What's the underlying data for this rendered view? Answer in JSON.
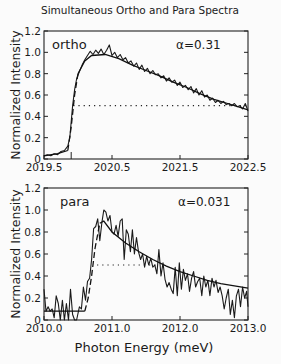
{
  "figure": {
    "title": "Simultaneous Ortho and Para Spectra",
    "xlabel": "Photon Energy (meV)"
  },
  "chart_data": [
    {
      "type": "line",
      "panel": "top",
      "label": "ortho",
      "annotation": "α=0.31",
      "ylabel": "Normalized Intensity",
      "xlabel": "Photon Energy (meV)",
      "xlim": [
        2019.5,
        2022.5
      ],
      "ylim": [
        0,
        1.2
      ],
      "xticks": [
        "2019.5",
        "2020.5",
        "2021.5",
        "2022.5"
      ],
      "yticks": [
        "0",
        "0.2",
        "0.4",
        "0.6",
        "0.8",
        "1.0",
        "1.2"
      ],
      "onset_marker_x": 2019.9,
      "half_max_line": {
        "y": 0.5,
        "x_start": 2019.93,
        "x_end": 2022.5
      },
      "series": [
        {
          "name": "measured",
          "x": [
            2019.5,
            2019.55,
            2019.6,
            2019.65,
            2019.7,
            2019.75,
            2019.8,
            2019.85,
            2019.88,
            2019.9,
            2019.92,
            2019.95,
            2019.98,
            2020.02,
            2020.06,
            2020.1,
            2020.14,
            2020.18,
            2020.22,
            2020.26,
            2020.3,
            2020.34,
            2020.38,
            2020.42,
            2020.46,
            2020.5,
            2020.54,
            2020.58,
            2020.62,
            2020.66,
            2020.7,
            2020.74,
            2020.78,
            2020.82,
            2020.86,
            2020.9,
            2020.94,
            2020.98,
            2021.02,
            2021.06,
            2021.1,
            2021.14,
            2021.18,
            2021.22,
            2021.26,
            2021.3,
            2021.34,
            2021.38,
            2021.42,
            2021.46,
            2021.5,
            2021.54,
            2021.58,
            2021.62,
            2021.66,
            2021.7,
            2021.74,
            2021.78,
            2021.82,
            2021.86,
            2021.9,
            2021.94,
            2021.98,
            2022.02,
            2022.06,
            2022.1,
            2022.14,
            2022.18,
            2022.22,
            2022.26,
            2022.3,
            2022.34,
            2022.38,
            2022.42,
            2022.46,
            2022.5
          ],
          "y": [
            0.03,
            0.04,
            0.03,
            0.05,
            0.04,
            0.07,
            0.08,
            0.12,
            0.2,
            0.35,
            0.5,
            0.65,
            0.75,
            0.82,
            0.88,
            0.93,
            0.97,
            1.01,
            0.98,
            1.02,
            0.99,
            1.03,
            0.98,
            1.02,
            1.07,
            0.97,
            1.0,
            0.95,
            0.98,
            0.93,
            0.95,
            0.9,
            0.92,
            0.87,
            0.9,
            0.84,
            0.88,
            0.82,
            0.85,
            0.8,
            0.83,
            0.79,
            0.8,
            0.76,
            0.78,
            0.73,
            0.76,
            0.72,
            0.74,
            0.69,
            0.72,
            0.67,
            0.69,
            0.65,
            0.68,
            0.62,
            0.66,
            0.6,
            0.64,
            0.58,
            0.6,
            0.55,
            0.57,
            0.53,
            0.55,
            0.52,
            0.54,
            0.51,
            0.52,
            0.5,
            0.52,
            0.49,
            0.5,
            0.47,
            0.52,
            0.45
          ]
        },
        {
          "name": "fit",
          "segments": [
            {
              "style": "solid",
              "x": [
                2019.5,
                2019.7,
                2019.85
              ],
              "y": [
                0.03,
                0.05,
                0.08
              ]
            },
            {
              "style": "dashed",
              "x": [
                2019.85,
                2019.9,
                2019.95,
                2020.0
              ],
              "y": [
                0.08,
                0.3,
                0.6,
                0.8
              ]
            },
            {
              "style": "solid",
              "x": [
                2020.0,
                2020.1,
                2020.2,
                2020.4,
                2020.6,
                2020.8,
                2021.0,
                2021.2,
                2021.4,
                2021.6,
                2021.8,
                2022.0,
                2022.2,
                2022.5
              ],
              "y": [
                0.8,
                0.92,
                0.97,
                0.98,
                0.94,
                0.88,
                0.83,
                0.78,
                0.72,
                0.67,
                0.61,
                0.56,
                0.52,
                0.46
              ]
            }
          ]
        }
      ]
    },
    {
      "type": "line",
      "panel": "bottom",
      "label": "para",
      "annotation": "α=0.031",
      "ylabel": "Normalized Intensity",
      "xlabel": "Photon Energy (meV)",
      "xlim": [
        2010.0,
        2013.0
      ],
      "ylim": [
        0,
        1.2
      ],
      "xticks": [
        "2010.0",
        "2011.0",
        "2012.0",
        "2013.0"
      ],
      "yticks": [
        "0",
        "0.2",
        "0.4",
        "0.6",
        "0.8",
        "1.0",
        "1.2"
      ],
      "half_max_line": {
        "y": 0.5,
        "x_start": 2010.78,
        "x_end": 2011.65
      },
      "series": [
        {
          "name": "measured",
          "x": [
            2010.0,
            2010.03,
            2010.06,
            2010.09,
            2010.12,
            2010.15,
            2010.18,
            2010.21,
            2010.24,
            2010.27,
            2010.3,
            2010.33,
            2010.36,
            2010.39,
            2010.42,
            2010.45,
            2010.48,
            2010.52,
            2010.55,
            2010.58,
            2010.61,
            2010.64,
            2010.67,
            2010.7,
            2010.73,
            2010.76,
            2010.79,
            2010.82,
            2010.85,
            2010.88,
            2010.91,
            2010.94,
            2010.97,
            2011.0,
            2011.03,
            2011.06,
            2011.09,
            2011.12,
            2011.15,
            2011.18,
            2011.21,
            2011.24,
            2011.27,
            2011.3,
            2011.33,
            2011.36,
            2011.39,
            2011.42,
            2011.45,
            2011.48,
            2011.51,
            2011.54,
            2011.57,
            2011.6,
            2011.63,
            2011.66,
            2011.69,
            2011.72,
            2011.75,
            2011.78,
            2011.81,
            2011.84,
            2011.87,
            2011.9,
            2011.93,
            2011.96,
            2011.99,
            2012.02,
            2012.05,
            2012.08,
            2012.11,
            2012.14,
            2012.17,
            2012.2,
            2012.23,
            2012.26,
            2012.29,
            2012.32,
            2012.35,
            2012.38,
            2012.41,
            2012.44,
            2012.47,
            2012.5,
            2012.53,
            2012.56,
            2012.59,
            2012.62,
            2012.65,
            2012.68,
            2012.71,
            2012.74,
            2012.77,
            2012.8,
            2012.83,
            2012.86,
            2012.89,
            2012.92,
            2012.95,
            2012.98,
            2013.0
          ],
          "y": [
            0.28,
            0.08,
            0.12,
            0.08,
            0.1,
            0.02,
            0.22,
            0.15,
            0.0,
            0.18,
            0.0,
            0.15,
            0.0,
            0.28,
            0.05,
            0.0,
            0.0,
            0.12,
            0.1,
            0.3,
            0.18,
            0.35,
            0.38,
            0.55,
            0.83,
            0.85,
            0.92,
            0.72,
            0.88,
            1.0,
            0.98,
            0.9,
            0.95,
            0.8,
            0.78,
            0.86,
            0.76,
            0.9,
            0.92,
            0.55,
            0.82,
            0.78,
            0.62,
            0.82,
            0.6,
            0.75,
            0.62,
            0.55,
            0.6,
            0.48,
            0.58,
            0.5,
            0.56,
            0.48,
            0.5,
            0.42,
            0.64,
            0.4,
            0.52,
            0.37,
            0.3,
            0.34,
            0.28,
            0.24,
            0.48,
            0.22,
            0.52,
            0.28,
            0.46,
            0.36,
            0.42,
            0.26,
            0.38,
            0.44,
            0.3,
            0.35,
            0.38,
            0.22,
            0.4,
            0.3,
            0.36,
            0.22,
            0.38,
            0.3,
            0.36,
            0.25,
            0.3,
            0.22,
            0.1,
            0.2,
            0.28,
            0.05,
            0.18,
            0.02,
            0.22,
            0.28,
            0.12,
            0.3,
            0.2,
            0.26,
            0.12
          ]
        },
        {
          "name": "fit",
          "segments": [
            {
              "style": "solid",
              "x": [
                2010.0,
                2010.6
              ],
              "y": [
                0.08,
                0.08
              ]
            },
            {
              "style": "dashed",
              "x": [
                2010.6,
                2010.65,
                2010.7,
                2010.75,
                2010.82
              ],
              "y": [
                0.08,
                0.2,
                0.4,
                0.65,
                0.88
              ]
            },
            {
              "style": "solid",
              "x": [
                2010.82,
                2010.88,
                2011.0,
                2011.2,
                2011.4,
                2011.6,
                2011.8,
                2012.0,
                2012.2,
                2012.4,
                2012.6,
                2012.8,
                2013.0
              ],
              "y": [
                0.88,
                0.9,
                0.8,
                0.7,
                0.62,
                0.55,
                0.49,
                0.44,
                0.4,
                0.36,
                0.33,
                0.31,
                0.29
              ]
            }
          ]
        }
      ]
    }
  ]
}
